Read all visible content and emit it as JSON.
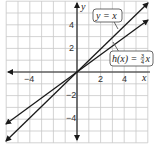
{
  "chart_data": {
    "type": "line",
    "title": "",
    "xlabel": "x",
    "ylabel": "y",
    "xlim": [
      -6,
      6
    ],
    "ylim": [
      -6,
      6
    ],
    "grid": true,
    "x_ticks_labeled": [
      -4,
      2,
      4
    ],
    "y_ticks_labeled": [
      4,
      2,
      -2,
      -4
    ],
    "series": [
      {
        "name": "y = x",
        "slope": 1,
        "intercept": 0,
        "x": [
          -6,
          6
        ],
        "y": [
          -6,
          6
        ]
      },
      {
        "name": "h(x) = 3/4 x",
        "slope": 0.75,
        "intercept": 0,
        "x": [
          -6,
          6
        ],
        "y": [
          -4.5,
          4.5
        ]
      }
    ],
    "annotations": [
      {
        "text": "y = x",
        "points_to": "line y = x"
      },
      {
        "text": "h(x) = ¾x",
        "points_to": "line h(x)"
      }
    ]
  },
  "labels": {
    "x_axis": "x",
    "y_axis": "y",
    "xt_m4": "−4",
    "xt_2": "2",
    "xt_4": "4",
    "yt_4": "4",
    "yt_2": "2",
    "yt_m2": "−2",
    "yt_m4": "−4",
    "callout1": "y = x",
    "callout2_pre": "h(x) = ",
    "callout2_num": "3",
    "callout2_den": "4",
    "callout2_post": "x"
  },
  "colors": {
    "grid": "#c8c8c8",
    "axis": "#222222",
    "line": "#1a1a1a"
  }
}
